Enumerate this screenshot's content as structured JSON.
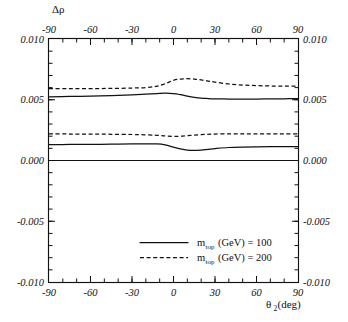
{
  "chart_data": {
    "type": "line",
    "title": "",
    "ylabel": "Δρ",
    "xlabel_main": "θ",
    "xlabel_sub": "2",
    "xlabel_tail": "(deg)",
    "xlabel_full": "θ2(deg)",
    "xlim": [
      -90,
      90
    ],
    "ylim": [
      -0.01,
      0.01
    ],
    "grid": false,
    "x_ticks": [
      -90,
      -60,
      -30,
      0,
      30,
      60,
      90
    ],
    "x_tick_labels": [
      "-90",
      "-60",
      "-30",
      "0",
      "30",
      "60",
      "90"
    ],
    "y_ticks": [
      -0.01,
      -0.005,
      0.0,
      0.005,
      0.01
    ],
    "y_tick_labels": [
      "-0.010",
      "-0.005",
      "0.000",
      "0.005",
      "0.010"
    ],
    "x_minor_step": 10,
    "y_minor_step": 0.001,
    "top_axis_labels": true,
    "right_axis_labels": true,
    "legend_position": "bottom-center",
    "zero_reference_line": 0.0,
    "series": [
      {
        "name": "m_top(GeV) = 100 (upper branch)",
        "style": "solid",
        "x": [
          -90,
          -75,
          -60,
          -45,
          -30,
          -20,
          -12,
          -6,
          0,
          5,
          10,
          15,
          20,
          25,
          30,
          40,
          50,
          60,
          70,
          80,
          90
        ],
        "values": [
          0.00524,
          0.00527,
          0.0053,
          0.00534,
          0.0054,
          0.00546,
          0.00551,
          0.00554,
          0.00551,
          0.00542,
          0.0053,
          0.0052,
          0.00513,
          0.0051,
          0.00508,
          0.00506,
          0.00506,
          0.00506,
          0.00507,
          0.00508,
          0.00509
        ]
      },
      {
        "name": "m_top(GeV) = 200 (upper branch)",
        "style": "dashed",
        "x": [
          -90,
          -75,
          -60,
          -45,
          -30,
          -20,
          -12,
          -6,
          0,
          5,
          10,
          15,
          20,
          25,
          30,
          40,
          50,
          60,
          70,
          80,
          90
        ],
        "values": [
          0.00591,
          0.00591,
          0.00592,
          0.00593,
          0.00596,
          0.00601,
          0.00612,
          0.00632,
          0.0066,
          0.0067,
          0.00673,
          0.0067,
          0.00663,
          0.00654,
          0.00645,
          0.0063,
          0.00621,
          0.00616,
          0.00613,
          0.00612,
          0.00612
        ]
      },
      {
        "name": "m_top(GeV) = 100 (lower branch)",
        "style": "solid",
        "x": [
          -90,
          -75,
          -60,
          -45,
          -30,
          -20,
          -12,
          -6,
          0,
          5,
          10,
          15,
          20,
          25,
          30,
          40,
          50,
          60,
          70,
          80,
          90
        ],
        "values": [
          0.00131,
          0.00132,
          0.00133,
          0.00134,
          0.00136,
          0.00137,
          0.00136,
          0.00128,
          0.0011,
          0.00096,
          0.00086,
          0.00083,
          0.00086,
          0.00092,
          0.00098,
          0.00107,
          0.00111,
          0.00113,
          0.00114,
          0.00114,
          0.00114
        ]
      },
      {
        "name": "m_top(GeV) = 200 (lower branch)",
        "style": "dashed",
        "x": [
          -90,
          -75,
          -60,
          -45,
          -30,
          -20,
          -12,
          -6,
          0,
          5,
          10,
          15,
          20,
          25,
          30,
          40,
          50,
          60,
          70,
          80,
          90
        ],
        "values": [
          0.00219,
          0.00218,
          0.00217,
          0.00216,
          0.00214,
          0.00211,
          0.00207,
          0.00202,
          0.00199,
          0.002,
          0.00204,
          0.00209,
          0.00213,
          0.00216,
          0.00218,
          0.0022,
          0.0022,
          0.0022,
          0.0022,
          0.0022,
          0.0022
        ]
      }
    ],
    "legend": [
      {
        "style": "solid",
        "label_main": "m",
        "label_sub": "top",
        "label_tail": "(GeV) = 100",
        "label_full": "mtop(GeV) = 100"
      },
      {
        "style": "dashed",
        "label_main": "m",
        "label_sub": "top",
        "label_tail": "(GeV) = 200",
        "label_full": "mtop(GeV) = 200"
      }
    ],
    "colors": {
      "axis": "#111111",
      "curve": "#111111",
      "background": "#ffffff"
    }
  }
}
